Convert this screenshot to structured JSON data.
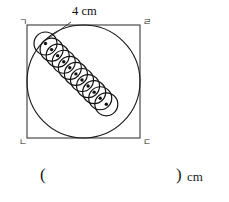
{
  "figure": {
    "square": {
      "label_top_left": "ㄱ",
      "label_top_right": "ㄹ",
      "label_bottom_left": "ㄴ",
      "label_bottom_right": "ㄷ",
      "x": 27,
      "y": 25,
      "size": 113,
      "stroke": "#3a3a3a",
      "stroke_width": 1.1
    },
    "inscribed_circle": {
      "cx": 83.5,
      "cy": 81.5,
      "r": 56.5,
      "stroke": "#1a1a1a",
      "stroke_width": 1.1,
      "fill": "none"
    },
    "small_circles": {
      "count": 11,
      "r": 11.5,
      "spacing": 8.6,
      "start_x": 45.5,
      "start_y": 43.5,
      "angle_deg": 45,
      "stroke": "#111111",
      "stroke_width": 1.2,
      "center_dot_r": 1.7,
      "center_dot_fill": "#111111"
    },
    "dimension": {
      "text": "4 cm",
      "x": 72,
      "y": 11,
      "leader_from_x": 71,
      "leader_from_y": 22,
      "leader_to_x": 46,
      "leader_to_y": 40
    }
  },
  "answer": {
    "paren_open": "(",
    "blank_value": "",
    "paren_close": ")",
    "unit": "cm"
  },
  "colors": {
    "ink": "#1a1a1a",
    "line": "#3a3a3a",
    "background": "#ffffff"
  }
}
